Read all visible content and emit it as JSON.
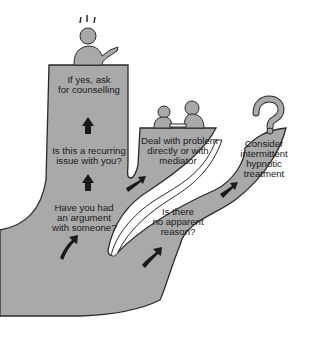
{
  "diagram": {
    "title": "",
    "colors": {
      "fill": "#a9a9a9",
      "outline": "#2a2a2a",
      "arrow": "#1a1a1a",
      "background": "#ffffff"
    },
    "nodes": [
      {
        "id": "argument",
        "lines": [
          "Have you had",
          "an argument",
          "with someone?"
        ]
      },
      {
        "id": "recurring",
        "lines": [
          "Is this a recurring",
          "issue with you?"
        ]
      },
      {
        "id": "counselling",
        "lines": [
          "If yes, ask",
          "for counselling"
        ]
      },
      {
        "id": "deal",
        "lines": [
          "Deal with problem",
          "directly or with",
          "mediator"
        ]
      },
      {
        "id": "no-reason",
        "lines": [
          "Is there",
          "no apparent",
          "reason?"
        ]
      },
      {
        "id": "hypnotic",
        "lines": [
          "Consider",
          "intermittent",
          "hypnotic",
          "treatment"
        ]
      }
    ],
    "illustrations": [
      {
        "id": "person-gesturing",
        "description": "person with raised hand and exclamation marks above head"
      },
      {
        "id": "two-people-at-table",
        "description": "two people seated facing each other"
      },
      {
        "id": "question-mark",
        "description": "large question mark"
      }
    ],
    "edges": [
      {
        "from": "argument",
        "to": "recurring",
        "arrow": "up"
      },
      {
        "from": "recurring",
        "to": "counselling",
        "arrow": "up"
      },
      {
        "from": "argument",
        "to": "deal",
        "arrow": "up-right"
      },
      {
        "from": "no-reason",
        "to": "hypnotic",
        "arrow": "up-right"
      }
    ]
  }
}
